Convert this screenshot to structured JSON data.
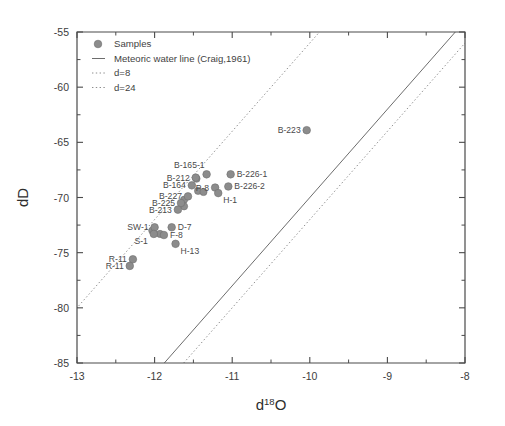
{
  "chart_data": {
    "type": "scatter",
    "title": "",
    "xlabel": "d 18 O",
    "xlabel_base": "d",
    "xlabel_sup": "18",
    "xlabel_tail": "O",
    "ylabel": "dD",
    "xlim": [
      -13,
      -8
    ],
    "ylim": [
      -85,
      -55
    ],
    "xticks": [
      -13,
      -12,
      -11,
      -10,
      -9,
      -8
    ],
    "xticklabels": [
      "-13",
      "-12",
      "-11",
      "-10",
      "-9",
      "-8"
    ],
    "yticks": [
      -55,
      -60,
      -65,
      -70,
      -75,
      -80,
      -85
    ],
    "yticklabels": [
      "-55",
      "-60",
      "-65",
      "-70",
      "-75",
      "-80",
      "-85"
    ],
    "minor_ticks": true,
    "grid": false,
    "legend_position": "upper-left",
    "legend": [
      {
        "label": "Samples",
        "style": "marker"
      },
      {
        "label": "Meteoric water line (Craig,1961)",
        "style": "solid-line"
      },
      {
        "label": "d=8",
        "style": "dotted-line"
      },
      {
        "label": "d=24",
        "style": "dotted-line"
      }
    ],
    "lines": [
      {
        "name": "Meteoric water line (Craig,1961)",
        "style": "solid",
        "intercept": 10,
        "slope": 8,
        "points": [
          [
            -11.875,
            -85
          ],
          [
            -8.125,
            -55
          ]
        ]
      },
      {
        "name": "d=8",
        "style": "dotted",
        "intercept": 8,
        "slope": 8,
        "points": [
          [
            -11.625,
            -85
          ],
          [
            -7.875,
            -55
          ]
        ]
      },
      {
        "name": "d=24",
        "style": "dotted",
        "intercept": 24,
        "slope": 8,
        "points": [
          [
            -13.625,
            -85
          ],
          [
            -9.875,
            -55
          ]
        ]
      }
    ],
    "series_name": "Samples",
    "points": [
      {
        "label": "B-223",
        "x": -10.04,
        "y": -63.9,
        "label_pos": "left"
      },
      {
        "label": "B-165-1",
        "x": -11.33,
        "y": -67.9,
        "label_pos": "above-left"
      },
      {
        "label": "B-226-1",
        "x": -11.02,
        "y": -67.9,
        "label_pos": "right"
      },
      {
        "label": "B-212",
        "x": -11.47,
        "y": -68.2,
        "label_pos": "left"
      },
      {
        "label": "B-164",
        "x": -11.52,
        "y": -68.9,
        "label_pos": "left"
      },
      {
        "label": "P-8",
        "x": -11.22,
        "y": -69.1,
        "label_pos": "left"
      },
      {
        "label": "B-226-2",
        "x": -11.05,
        "y": -69.0,
        "label_pos": "right"
      },
      {
        "label": "H-1",
        "x": -11.18,
        "y": -69.6,
        "label_pos": "below-right"
      },
      {
        "label": "B-227",
        "x": -11.57,
        "y": -69.9,
        "label_pos": "left"
      },
      {
        "label": "B-225",
        "x": -11.66,
        "y": -70.5,
        "label_pos": "left"
      },
      {
        "label": "B-213",
        "x": -11.7,
        "y": -71.1,
        "label_pos": "left"
      },
      {
        "label": "SW-1",
        "x": -12.0,
        "y": -72.7,
        "label_pos": "left"
      },
      {
        "label": "D-7",
        "x": -11.78,
        "y": -72.7,
        "label_pos": "right"
      },
      {
        "label": "S-1",
        "x": -12.01,
        "y": -73.3,
        "label_pos": "below-left"
      },
      {
        "label": "F-8",
        "x": -11.88,
        "y": -73.4,
        "label_pos": "right"
      },
      {
        "label": "H-13",
        "x": -11.73,
        "y": -74.2,
        "label_pos": "below-right"
      },
      {
        "label": "R-11",
        "x": -12.28,
        "y": -75.6,
        "label_pos": "left"
      },
      {
        "label": "R-11",
        "x": -12.32,
        "y": -76.2,
        "label_pos": "left"
      }
    ],
    "extra_markers": [
      {
        "x": -11.62,
        "y": -70.2
      },
      {
        "x": -11.44,
        "y": -69.4
      },
      {
        "x": -11.37,
        "y": -69.5
      },
      {
        "x": -11.46,
        "y": -68.3
      },
      {
        "x": -11.62,
        "y": -70.8
      },
      {
        "x": -12.03,
        "y": -73.0
      },
      {
        "x": -11.93,
        "y": -73.3
      }
    ]
  }
}
